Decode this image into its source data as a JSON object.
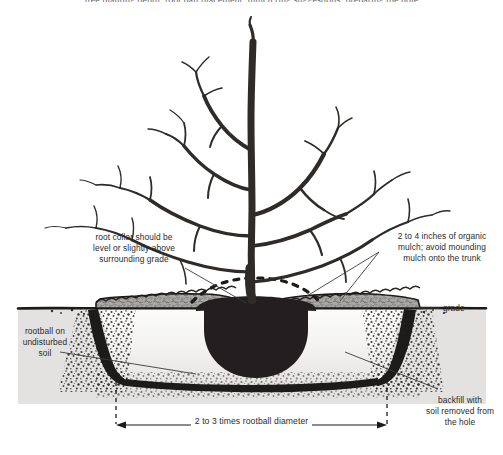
{
  "figure": {
    "cropped_text_top": "tree planting depth; root ball placement; mulch ring suggestions; preparing the hole",
    "colors": {
      "ink": "#231f20",
      "text": "#2b2b2b",
      "mulch_fill": "#a8a8a8",
      "ground_fill": "#e2e1df",
      "backfill_fill": "#f0efed",
      "rootball_fill": "#231f20",
      "background": "#ffffff"
    }
  },
  "labels": {
    "root_collar": "root collar should be\nlevel or slightly above\nsurrounding grade",
    "mulch": "2 to 4 inches of organic\nmulch; avoid mounding\nmulch onto the trunk",
    "rootball": "rootball on\nundisturbed\nsoil",
    "grade": "grade",
    "backfill": "backfill with\nsoil removed from\nthe hole",
    "dimension": "2 to 3 times rootball diameter"
  },
  "elements": {
    "tree": "bare-deciduous-tree",
    "trunk": "tree-trunk",
    "rootball": "rootball-mass",
    "mulch_layer": "organic-mulch-layer",
    "grade_line": "existing-grade-line",
    "planting_hole": "planting-hole",
    "dimension_arrow": "width-dimension-arrow"
  }
}
